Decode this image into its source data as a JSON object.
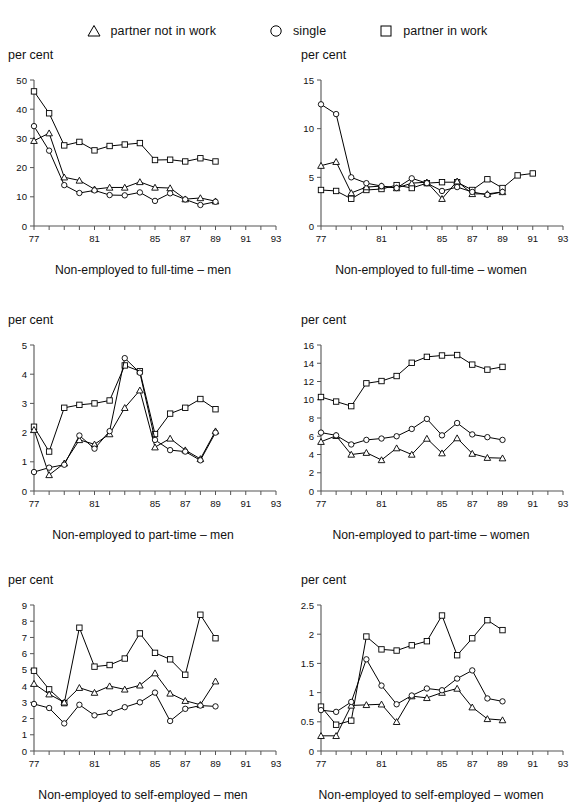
{
  "legend": {
    "items": [
      {
        "marker": "triangle",
        "marker_icon": "triangle-marker-icon",
        "label": "partner not in work"
      },
      {
        "marker": "circle",
        "marker_icon": "circle-marker-icon",
        "label": "single"
      },
      {
        "marker": "square",
        "marker_icon": "square-marker-icon",
        "label": "partner in work"
      }
    ]
  },
  "axis_title": "per cent",
  "colors": {
    "line": "#000000",
    "axis": "#555555",
    "text": "#111111",
    "marker_fill": "#ffffff"
  },
  "chart_data": [
    {
      "id": "non-employed-to-full-time-men",
      "type": "line",
      "title": "Non-employed to full-time – men",
      "xlabel": "",
      "ylabel": "per cent",
      "grid": false,
      "legend_position": "top",
      "x": [
        77,
        78,
        79,
        80,
        81,
        82,
        83,
        84,
        85,
        86,
        87,
        88,
        89,
        90,
        91,
        92,
        93
      ],
      "xtick_labels": [
        "77",
        "",
        "",
        "",
        "81",
        "",
        "",
        "",
        "85",
        "",
        "87",
        "",
        "89",
        "",
        "91",
        "",
        "93"
      ],
      "xlim": [
        77,
        93
      ],
      "ylim": [
        0,
        50
      ],
      "yticks": [
        0,
        10,
        20,
        30,
        40,
        50
      ],
      "ytick_labels": [
        "0",
        "10",
        "20",
        "30",
        "40",
        "50"
      ],
      "series": [
        {
          "name": "partner in work",
          "marker": "square",
          "values": [
            46.1,
            38.6,
            27.6,
            28.8,
            25.9,
            27.4,
            27.9,
            28.4,
            22.6,
            22.7,
            22.1,
            23.2,
            22.1,
            null,
            null,
            null,
            null
          ]
        },
        {
          "name": "partner not in work",
          "marker": "triangle",
          "values": [
            29.2,
            31.8,
            16.7,
            15.6,
            12.6,
            13.2,
            13.2,
            15.1,
            13.2,
            13.0,
            9.2,
            9.6,
            8.5,
            null,
            null,
            null,
            null
          ]
        },
        {
          "name": "single",
          "marker": "circle",
          "values": [
            34.2,
            25.8,
            14.0,
            11.3,
            12.2,
            10.6,
            10.5,
            11.5,
            8.6,
            11.2,
            9.1,
            7.2,
            8.3,
            null,
            null,
            null,
            null
          ]
        }
      ]
    },
    {
      "id": "non-employed-to-full-time-women",
      "type": "line",
      "title": "Non-employed to full-time – women",
      "xlabel": "",
      "ylabel": "per cent",
      "grid": false,
      "legend_position": "top",
      "x": [
        77,
        78,
        79,
        80,
        81,
        82,
        83,
        84,
        85,
        86,
        87,
        88,
        89,
        90,
        91,
        92,
        93
      ],
      "xtick_labels": [
        "77",
        "",
        "",
        "",
        "81",
        "",
        "",
        "",
        "85",
        "",
        "87",
        "",
        "89",
        "",
        "91",
        "",
        "93"
      ],
      "xlim": [
        77,
        93
      ],
      "ylim": [
        0,
        15
      ],
      "yticks": [
        0,
        5,
        10,
        15
      ],
      "ytick_labels": [
        "0",
        "5",
        "10",
        "15"
      ],
      "series": [
        {
          "name": "partner in work",
          "marker": "square",
          "values": [
            3.7,
            3.6,
            2.8,
            3.7,
            3.8,
            4.2,
            3.9,
            4.4,
            4.5,
            4.5,
            3.7,
            4.8,
            3.9,
            5.2,
            5.4,
            null,
            null
          ]
        },
        {
          "name": "partner not in work",
          "marker": "triangle",
          "values": [
            6.2,
            6.6,
            3.4,
            4.0,
            4.1,
            3.9,
            4.4,
            4.5,
            2.8,
            4.6,
            3.3,
            3.3,
            3.5,
            null,
            null,
            null,
            null
          ]
        },
        {
          "name": "single",
          "marker": "circle",
          "values": [
            12.5,
            11.5,
            5.0,
            4.4,
            4.1,
            3.9,
            4.9,
            4.4,
            3.6,
            4.0,
            3.5,
            3.2,
            3.5,
            null,
            null,
            null,
            null
          ]
        }
      ]
    },
    {
      "id": "non-employed-to-part-time-men",
      "type": "line",
      "title": "Non-employed to part-time – men",
      "xlabel": "",
      "ylabel": "per cent",
      "grid": false,
      "legend_position": "top",
      "x": [
        77,
        78,
        79,
        80,
        81,
        82,
        83,
        84,
        85,
        86,
        87,
        88,
        89,
        90,
        91,
        92,
        93
      ],
      "xtick_labels": [
        "77",
        "",
        "",
        "",
        "81",
        "",
        "",
        "",
        "85",
        "",
        "87",
        "",
        "89",
        "",
        "91",
        "",
        "93"
      ],
      "xlim": [
        77,
        93
      ],
      "ylim": [
        0,
        5
      ],
      "yticks": [
        0,
        1,
        2,
        3,
        4,
        5
      ],
      "ytick_labels": [
        "0",
        "1",
        "2",
        "3",
        "4",
        "5"
      ],
      "series": [
        {
          "name": "partner in work",
          "marker": "square",
          "values": [
            2.2,
            1.35,
            2.85,
            2.95,
            3.0,
            3.1,
            4.3,
            4.1,
            1.95,
            2.65,
            2.85,
            3.15,
            2.8,
            null,
            null,
            null,
            null
          ]
        },
        {
          "name": "partner not in work",
          "marker": "triangle",
          "values": [
            2.1,
            0.55,
            0.95,
            1.75,
            1.6,
            1.95,
            2.85,
            3.45,
            1.5,
            1.8,
            1.4,
            1.1,
            2.05,
            null,
            null,
            null,
            null
          ]
        },
        {
          "name": "single",
          "marker": "circle",
          "values": [
            0.65,
            0.8,
            0.9,
            1.9,
            1.45,
            2.05,
            4.55,
            4.05,
            1.75,
            1.4,
            1.35,
            1.05,
            2.0,
            null,
            null,
            null,
            null
          ]
        }
      ]
    },
    {
      "id": "non-employed-to-part-time-women",
      "type": "line",
      "title": "Non-employed to part-time – women",
      "xlabel": "",
      "ylabel": "per cent",
      "grid": false,
      "legend_position": "top",
      "x": [
        77,
        78,
        79,
        80,
        81,
        82,
        83,
        84,
        85,
        86,
        87,
        88,
        89,
        90,
        91,
        92,
        93
      ],
      "xtick_labels": [
        "77",
        "",
        "",
        "",
        "81",
        "",
        "",
        "",
        "85",
        "",
        "87",
        "",
        "89",
        "",
        "91",
        "",
        "93"
      ],
      "xlim": [
        77,
        93
      ],
      "ylim": [
        0,
        16
      ],
      "yticks": [
        0,
        2,
        4,
        6,
        8,
        10,
        12,
        14,
        16
      ],
      "ytick_labels": [
        "0",
        "2",
        "4",
        "6",
        "8",
        "10",
        "12",
        "14",
        "16"
      ],
      "series": [
        {
          "name": "partner in work",
          "marker": "square",
          "values": [
            10.3,
            9.8,
            9.3,
            11.8,
            12.05,
            12.6,
            14.05,
            14.7,
            14.85,
            14.9,
            13.85,
            13.3,
            13.6,
            null,
            null,
            null,
            null
          ]
        },
        {
          "name": "partner not in work",
          "marker": "triangle",
          "values": [
            5.4,
            6.05,
            4.0,
            4.2,
            3.4,
            4.7,
            4.0,
            5.75,
            4.15,
            5.8,
            4.1,
            3.65,
            3.6,
            null,
            null,
            null,
            null
          ]
        },
        {
          "name": "single",
          "marker": "circle",
          "values": [
            6.4,
            6.1,
            5.1,
            5.6,
            5.75,
            6.0,
            6.8,
            7.9,
            6.1,
            7.45,
            6.2,
            5.9,
            5.6,
            null,
            null,
            null,
            null
          ]
        }
      ]
    },
    {
      "id": "non-employed-to-self-employed-men",
      "type": "line",
      "title": "Non-employed to self-employed – men",
      "xlabel": "",
      "ylabel": "per cent",
      "grid": false,
      "legend_position": "top",
      "x": [
        77,
        78,
        79,
        80,
        81,
        82,
        83,
        84,
        85,
        86,
        87,
        88,
        89,
        90,
        91,
        92,
        93
      ],
      "xtick_labels": [
        "77",
        "",
        "",
        "",
        "81",
        "",
        "",
        "",
        "85",
        "",
        "87",
        "",
        "89",
        "",
        "91",
        "",
        "93"
      ],
      "xlim": [
        77,
        93
      ],
      "ylim": [
        0,
        9
      ],
      "yticks": [
        0,
        1,
        2,
        3,
        4,
        5,
        6,
        7,
        8,
        9
      ],
      "ytick_labels": [
        "0",
        "1",
        "2",
        "3",
        "4",
        "5",
        "6",
        "7",
        "8",
        "9"
      ],
      "series": [
        {
          "name": "partner in work",
          "marker": "square",
          "values": [
            4.95,
            3.8,
            2.95,
            7.6,
            5.2,
            5.3,
            5.7,
            7.25,
            6.05,
            5.65,
            4.7,
            8.4,
            6.95,
            null,
            null,
            null,
            null
          ]
        },
        {
          "name": "partner not in work",
          "marker": "triangle",
          "values": [
            4.15,
            3.5,
            3.0,
            3.9,
            3.6,
            4.0,
            3.8,
            4.05,
            4.8,
            3.55,
            3.1,
            2.85,
            4.3,
            null,
            null,
            null,
            null
          ]
        },
        {
          "name": "single",
          "marker": "circle",
          "values": [
            2.9,
            2.65,
            1.7,
            2.85,
            2.2,
            2.35,
            2.7,
            3.0,
            3.6,
            1.85,
            2.6,
            2.8,
            2.75,
            null,
            null,
            null,
            null
          ]
        }
      ]
    },
    {
      "id": "non-employed-to-self-employed-women",
      "type": "line",
      "title": "Non-employed to self-employed – women",
      "xlabel": "",
      "ylabel": "per cent",
      "grid": false,
      "legend_position": "top",
      "x": [
        77,
        78,
        79,
        80,
        81,
        82,
        83,
        84,
        85,
        86,
        87,
        88,
        89,
        90,
        91,
        92,
        93
      ],
      "xtick_labels": [
        "77",
        "",
        "",
        "",
        "81",
        "",
        "",
        "",
        "85",
        "",
        "87",
        "",
        "89",
        "",
        "91",
        "",
        "93"
      ],
      "xlim": [
        77,
        93
      ],
      "ylim": [
        0,
        2.5
      ],
      "yticks": [
        0,
        0.5,
        1,
        1.5,
        2,
        2.5
      ],
      "ytick_labels": [
        "0",
        "0.5",
        "1",
        "1.5",
        "2",
        "2.5"
      ],
      "series": [
        {
          "name": "partner in work",
          "marker": "square",
          "values": [
            0.76,
            0.45,
            0.52,
            1.96,
            1.74,
            1.72,
            1.81,
            1.88,
            2.32,
            1.64,
            1.93,
            2.24,
            2.07,
            null,
            null,
            null,
            null
          ]
        },
        {
          "name": "partner not in work",
          "marker": "triangle",
          "values": [
            0.26,
            0.26,
            0.78,
            0.79,
            0.8,
            0.5,
            0.94,
            0.91,
            1.0,
            1.07,
            0.75,
            0.55,
            0.53,
            null,
            null,
            null,
            null
          ]
        },
        {
          "name": "single",
          "marker": "circle",
          "values": [
            0.7,
            0.67,
            0.84,
            1.57,
            1.12,
            0.8,
            0.95,
            1.07,
            1.04,
            1.24,
            1.38,
            0.9,
            0.85,
            null,
            null,
            null,
            null
          ]
        }
      ]
    }
  ]
}
